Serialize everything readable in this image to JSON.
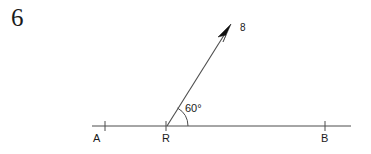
{
  "figure": {
    "problem_number": "6",
    "background_color": "#ffffff",
    "line_color": "#4d4d4d",
    "text_color": "#1a1a1a",
    "arrow_fill_color": "#111111"
  },
  "baseline": {
    "name": "line-AB",
    "start_x": 92,
    "end_x": 351,
    "y": 126,
    "left_endpoint_label": "A",
    "left_endpoint_tick_x": 105,
    "left_endpoint_label_x": 93,
    "vertex_label": "R",
    "vertex_tick_x": 166,
    "vertex_label_x": 162,
    "right_endpoint_label": "B",
    "right_endpoint_tick_x": 325,
    "right_endpoint_label_x": 321,
    "label_y": 142,
    "tick_half_height": 5
  },
  "ray": {
    "name": "ray-R8",
    "origin_x": 167,
    "origin_y": 126,
    "tip_x": 231,
    "tip_y": 24,
    "label": "8",
    "label_x": 240,
    "label_y": 31
  },
  "angle": {
    "name": "angle-60",
    "label": "60°",
    "measure_degrees": 60,
    "label_x": 185,
    "label_y": 112,
    "arc_radius": 21,
    "arc_start_x": 188,
    "arc_start_y": 126,
    "arc_end_x": 177,
    "arc_end_y": 108
  }
}
